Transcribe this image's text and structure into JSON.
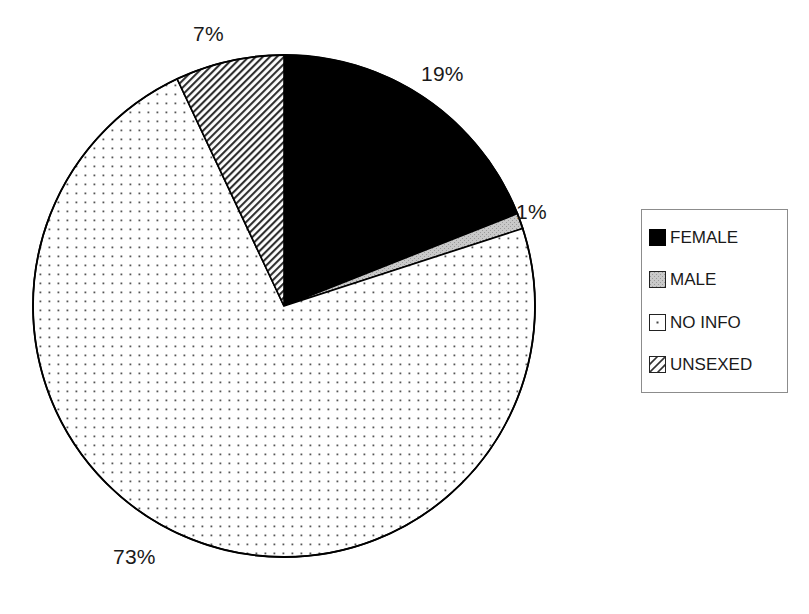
{
  "chart_data": {
    "type": "pie",
    "title": "",
    "categories": [
      "FEMALE",
      "MALE",
      "NO INFO",
      "UNSEXED"
    ],
    "values": [
      19,
      1,
      73,
      7
    ],
    "value_unit": "%",
    "data_labels": [
      "19%",
      "1%",
      "73%",
      "7%"
    ],
    "start_angle_deg": 0,
    "direction": "clockwise",
    "legend_position": "right",
    "grid": false,
    "slice_styles": [
      {
        "name": "FEMALE",
        "fill": "#000000",
        "pattern": "solid",
        "stroke": "#000000"
      },
      {
        "name": "MALE",
        "fill": "#c9c9c9",
        "pattern": "gray-solid",
        "stroke": "#000000"
      },
      {
        "name": "NO INFO",
        "fill": "#ffffff",
        "pattern": "dot-grid",
        "stroke": "#000000"
      },
      {
        "name": "UNSEXED",
        "fill": "#ffffff",
        "pattern": "diagonal-hatch",
        "stroke": "#000000"
      }
    ]
  },
  "labels": {
    "female_pct": "19%",
    "male_pct": "1%",
    "no_info_pct": "73%",
    "unsexed_pct": "7%"
  },
  "legend": {
    "items": [
      {
        "label": "FEMALE",
        "swatch": "solid-black-swatch"
      },
      {
        "label": "MALE",
        "swatch": "gray-dot-swatch"
      },
      {
        "label": "NO INFO",
        "swatch": "sparse-dot-swatch"
      },
      {
        "label": "UNSEXED",
        "swatch": "hatch-swatch"
      }
    ]
  },
  "colors": {
    "outline": "#000000",
    "text": "#1a1a1a",
    "legend_border": "#8c8c8c",
    "gray_fill": "#c9c9c9",
    "background": "#ffffff"
  }
}
